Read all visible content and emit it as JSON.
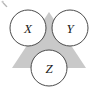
{
  "figure": {
    "kind": "triangle-venn-diagram",
    "background_color": "#ffffff",
    "width": 98,
    "height": 94,
    "triangle": {
      "name": "gray-backing-triangle",
      "fill_color": "#c9c9c9",
      "points": "49,12 86,68 12,68"
    },
    "nodes": [
      {
        "id": "x",
        "label": "X",
        "cx": 28,
        "cy": 28,
        "r": 18,
        "fill_color": "#ffffff",
        "stroke_color": "#4a4a4a"
      },
      {
        "id": "y",
        "label": "Y",
        "cx": 70,
        "cy": 28,
        "r": 18,
        "fill_color": "#ffffff",
        "stroke_color": "#4a4a4a"
      },
      {
        "id": "z",
        "label": "Z",
        "cx": 49,
        "cy": 68,
        "r": 18,
        "fill_color": "#ffffff",
        "stroke_color": "#4a4a4a"
      }
    ],
    "artifact": {
      "name": "scan-speck",
      "x": 3,
      "y": 2,
      "color": "#9a9a9a"
    }
  }
}
